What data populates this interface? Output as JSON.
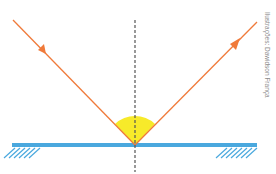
{
  "diagram": {
    "type": "light reflection on plane mirror",
    "credit": "Ilustrações: Dawidson França",
    "colors": {
      "ray": "#f07a3a",
      "mirror": "#4aa8de",
      "hatch": "#4aa8de",
      "normal": "#555555",
      "angle_fill": "#f7ea2a"
    },
    "elements": [
      "incident-ray",
      "reflected-ray",
      "normal-line",
      "mirror",
      "angle-sector"
    ]
  }
}
